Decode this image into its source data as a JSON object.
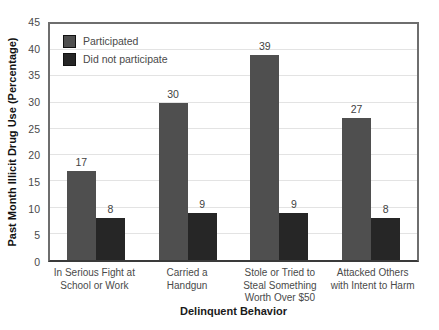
{
  "chart_data": {
    "type": "bar",
    "title": "",
    "xlabel": "Delinquent Behavior",
    "ylabel": "Past Month Illicit Drug Use (Percentage)",
    "ylim": [
      0,
      45
    ],
    "ytick_step": 5,
    "yticks": [
      45,
      40,
      35,
      30,
      25,
      20,
      15,
      10,
      5,
      0
    ],
    "grid": "horizontal-light",
    "legend_position": "top-left-inside",
    "categories": [
      "In Serious Fight at\nSchool or Work",
      "Carried a\nHandgun",
      "Stole or Tried to\nSteal Something\nWorth Over $50",
      "Attacked Others\nwith Intent to Harm"
    ],
    "series": [
      {
        "name": "Participated",
        "color": "#4f4f4f",
        "values": [
          17,
          30,
          39,
          27
        ]
      },
      {
        "name": "Did not participate",
        "color": "#262626",
        "values": [
          8,
          9,
          9,
          8
        ]
      }
    ]
  },
  "colors": {
    "plot_border": "#6e6e6e",
    "axis_line": "#3a3a3a",
    "gridline": "#e3e3e3",
    "tick_text": "#4a4a4a",
    "value_text": "#3f3f3f",
    "title_text": "#111111",
    "background": "#ffffff"
  }
}
